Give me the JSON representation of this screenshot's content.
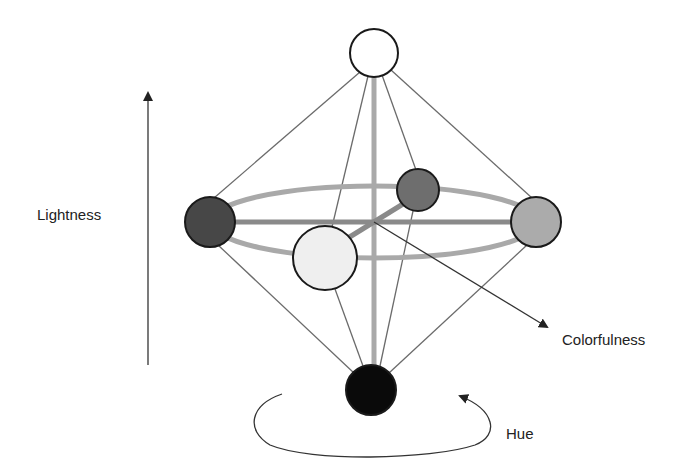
{
  "labels": {
    "lightness": "Lightness",
    "colorfulness": "Colorfulness",
    "hue": "Hue"
  },
  "colors": {
    "background": "#ffffff",
    "thin_line": "#6b6b6b",
    "thick_line": "#a9a9a9",
    "equator_axis": "#8a8a8a",
    "outline": "#1a1a1a",
    "arrow": "#333333"
  },
  "nodes": [
    {
      "id": "top-white",
      "cx": 374,
      "cy": 53,
      "r": 24,
      "fill": "#ffffff"
    },
    {
      "id": "left-dark",
      "cx": 210,
      "cy": 222,
      "r": 25,
      "fill": "#474747"
    },
    {
      "id": "back-medium",
      "cx": 418,
      "cy": 190,
      "r": 21,
      "fill": "#6e6e6e"
    },
    {
      "id": "right-light",
      "cx": 536,
      "cy": 222,
      "r": 25,
      "fill": "#ababab"
    },
    {
      "id": "front-pale",
      "cx": 325,
      "cy": 258,
      "r": 32,
      "fill": "#efefef"
    },
    {
      "id": "bottom-black",
      "cx": 371,
      "cy": 390,
      "r": 25,
      "fill": "#0a0a0a"
    }
  ]
}
